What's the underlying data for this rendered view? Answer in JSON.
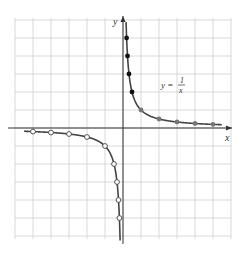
{
  "chart_data": {
    "type": "line",
    "title": "",
    "xlabel": "x",
    "ylabel": "y",
    "annotation": {
      "lhs": "y =",
      "numerator": "1",
      "denominator": "x"
    },
    "xlim": [
      -6,
      6
    ],
    "ylim": [
      -6,
      6
    ],
    "grid": true,
    "grid_step": 1,
    "series": [
      {
        "name": "y = 1/x (x > 0, filled)",
        "marker": "filled-black",
        "points": [
          [
            0.2,
            5
          ],
          [
            0.25,
            4
          ],
          [
            0.333,
            3
          ],
          [
            0.5,
            2
          ]
        ]
      },
      {
        "name": "y = 1/x (x > 0, gray)",
        "marker": "filled-gray",
        "points": [
          [
            1,
            1
          ],
          [
            2,
            0.5
          ],
          [
            3,
            0.333
          ],
          [
            4,
            0.25
          ],
          [
            5,
            0.2
          ]
        ]
      },
      {
        "name": "y = 1/x (x < 0, open)",
        "marker": "open-circle",
        "points": [
          [
            -5,
            -0.2
          ],
          [
            -4,
            -0.25
          ],
          [
            -3,
            -0.333
          ],
          [
            -2,
            -0.5
          ],
          [
            -1,
            -1
          ],
          [
            -0.5,
            -2
          ],
          [
            -0.333,
            -3
          ],
          [
            -0.25,
            -4
          ],
          [
            -0.2,
            -5
          ]
        ]
      }
    ]
  },
  "labels": {
    "x_axis": "x",
    "y_axis": "y",
    "eq_lhs": "y =",
    "eq_num": "1",
    "eq_den": "x"
  },
  "colors": {
    "grid": "#cfcfcf",
    "axis": "#333333",
    "curve": "#444444",
    "filled": "#111111",
    "gray": "#777777"
  }
}
